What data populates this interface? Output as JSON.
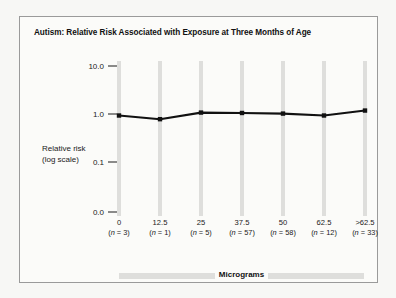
{
  "chart_data": {
    "type": "line",
    "title": "Autism: Relative Risk Associated with Exposure at Three Months of Age",
    "xlabel": "Micrograms",
    "ylabel": "Relative risk\n(log scale)",
    "ylabel_line1": "Relative risk",
    "ylabel_line2": "(log scale)",
    "categories": [
      "0",
      "12.5",
      "25",
      "37.5",
      "50",
      "62.5",
      ">62.5"
    ],
    "counts": [
      "(n = 3)",
      "(n = 1)",
      "(n = 5)",
      "(n = 57)",
      "(n = 58)",
      "(n = 12)",
      "(n = 33)"
    ],
    "n_values": [
      3,
      1,
      5,
      57,
      58,
      12,
      33
    ],
    "values": [
      0.93,
      0.78,
      1.07,
      1.05,
      1.02,
      0.93,
      1.18
    ],
    "ytick_labels": [
      "10.0",
      "1.0",
      "0.1",
      "0.0"
    ],
    "ytick_values": [
      10.0,
      1.0,
      0.1,
      0.0
    ],
    "yscale": "log",
    "grid": "vertical-bands",
    "legend": "none",
    "series": [
      {
        "name": "Relative risk",
        "values": [
          0.93,
          0.78,
          1.07,
          1.05,
          1.02,
          0.93,
          1.18
        ]
      }
    ],
    "colors": {
      "line": "#111111",
      "marker": "#111111",
      "gridband": "#dededc",
      "frame": "#9a9a9a",
      "background": "#fbfbf9",
      "page": "#f7f7f5"
    }
  }
}
